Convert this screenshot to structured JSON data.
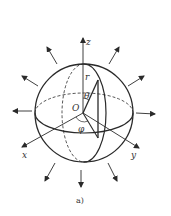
{
  "figure": {
    "caption": "a)",
    "labels": {
      "z_axis": "z",
      "x_axis": "x",
      "y_axis": "y",
      "origin": "O",
      "radius": "r",
      "polar_angle": "θ",
      "azimuth_angle": "φ"
    },
    "colors": {
      "stroke": "#2a2a2a",
      "background": "#ffffff"
    },
    "arrow_count": 10
  }
}
